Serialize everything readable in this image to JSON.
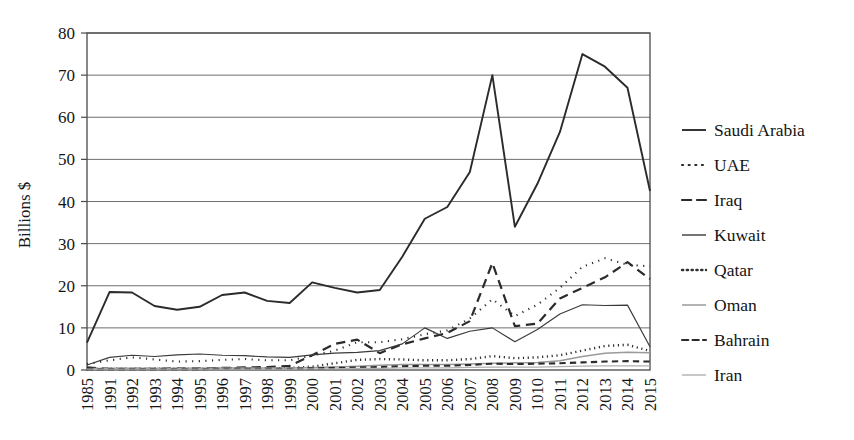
{
  "chart_data": {
    "type": "line",
    "title": "",
    "xlabel": "",
    "ylabel": "Billions $",
    "ylim": [
      0,
      80
    ],
    "yticks": [
      0,
      10,
      20,
      30,
      40,
      50,
      60,
      70,
      80
    ],
    "grid": true,
    "legend_position": "right",
    "categories": [
      "1985",
      "1991",
      "1992",
      "1993",
      "1994",
      "1995",
      "1996",
      "1997",
      "1998",
      "1999",
      "2000",
      "2001",
      "2002",
      "2003",
      "2004",
      "2005",
      "2006",
      "2007",
      "2008",
      "2009",
      "1010",
      "2011",
      "2012",
      "2013",
      "2014",
      "2015"
    ],
    "series": [
      {
        "name": "Saudi Arabia",
        "style": "solid",
        "color": "#2b2b2b",
        "width": 1.9,
        "values": [
          6.5,
          18.5,
          18.4,
          15.2,
          14.3,
          15.0,
          17.8,
          18.4,
          16.4,
          15.9,
          20.8,
          19.5,
          18.4,
          19.0,
          26.9,
          35.9,
          38.7,
          47.0,
          70.0,
          34.0,
          44.2,
          56.5,
          75.0,
          72.0,
          67.0,
          42.5
        ]
      },
      {
        "name": "UAE",
        "style": "dotted",
        "color": "#2b2b2b",
        "width": 2.1,
        "values": [
          1.4,
          2.3,
          3.0,
          2.5,
          2.0,
          2.1,
          2.4,
          2.6,
          2.3,
          2.3,
          3.4,
          4.6,
          6.6,
          6.6,
          7.3,
          8.5,
          9.4,
          12.2,
          16.8,
          12.8,
          15.5,
          19.5,
          24.5,
          26.5,
          25.0,
          24.6
        ]
      },
      {
        "name": "Iraq",
        "style": "dashed",
        "color": "#2b2b2b",
        "width": 2.2,
        "values": [
          0.6,
          0.3,
          0.3,
          0.3,
          0.4,
          0.4,
          0.5,
          0.6,
          0.7,
          1.0,
          3.5,
          6.2,
          7.2,
          4.0,
          6.1,
          7.5,
          8.8,
          11.6,
          25.4,
          10.4,
          11.0,
          17.0,
          19.5,
          22.0,
          25.6,
          21.6
        ]
      },
      {
        "name": "Kuwait",
        "style": "solid",
        "color": "#3a3a3a",
        "width": 1.15,
        "values": [
          1.2,
          3.0,
          3.5,
          3.2,
          3.6,
          3.8,
          3.5,
          3.4,
          3.1,
          3.0,
          3.6,
          4.0,
          4.2,
          4.6,
          6.2,
          10.0,
          7.5,
          9.2,
          10.0,
          6.7,
          9.6,
          13.3,
          15.5,
          15.3,
          15.4,
          5.5
        ]
      },
      {
        "name": "Qatar",
        "style": "fine-dotted",
        "color": "#2f2f2f",
        "width": 2.4,
        "values": [
          0.2,
          0.3,
          0.3,
          0.3,
          0.3,
          0.3,
          0.4,
          0.4,
          0.4,
          0.5,
          0.8,
          1.6,
          2.4,
          2.6,
          2.5,
          2.3,
          2.3,
          2.6,
          3.3,
          2.8,
          3.0,
          3.5,
          4.6,
          5.7,
          6.0,
          4.5
        ]
      },
      {
        "name": "Oman",
        "style": "solid-light",
        "color": "#9a9a9a",
        "width": 1.5,
        "values": [
          0.3,
          0.4,
          0.4,
          0.4,
          0.4,
          0.4,
          0.5,
          0.5,
          0.5,
          0.5,
          0.6,
          0.7,
          0.9,
          1.1,
          1.3,
          1.3,
          1.3,
          1.4,
          1.6,
          1.7,
          1.8,
          2.2,
          3.2,
          4.0,
          4.2,
          4.1
        ]
      },
      {
        "name": "Bahrain",
        "style": "short-dashed",
        "color": "#2b2b2b",
        "width": 2.1,
        "values": [
          0.2,
          0.2,
          0.2,
          0.2,
          0.2,
          0.2,
          0.3,
          0.3,
          0.3,
          0.3,
          0.4,
          0.5,
          0.6,
          0.7,
          0.9,
          1.0,
          1.0,
          1.2,
          1.5,
          1.4,
          1.5,
          1.6,
          1.8,
          2.0,
          2.1,
          2.0
        ]
      },
      {
        "name": "Iran",
        "style": "solid-light",
        "color": "#b0b0b0",
        "width": 1.2,
        "values": [
          0.2,
          0.2,
          0.2,
          0.2,
          0.2,
          0.2,
          0.2,
          0.2,
          0.2,
          0.2,
          0.3,
          0.3,
          0.4,
          0.4,
          0.5,
          0.5,
          0.5,
          0.6,
          0.7,
          0.7,
          0.7,
          0.8,
          0.9,
          1.0,
          1.0,
          1.0
        ]
      }
    ]
  },
  "legend": {
    "entries": [
      {
        "label": "Saudi Arabia"
      },
      {
        "label": "UAE"
      },
      {
        "label": "Iraq"
      },
      {
        "label": "Kuwait"
      },
      {
        "label": "Qatar"
      },
      {
        "label": "Oman"
      },
      {
        "label": "Bahrain"
      },
      {
        "label": "Iran"
      }
    ]
  }
}
